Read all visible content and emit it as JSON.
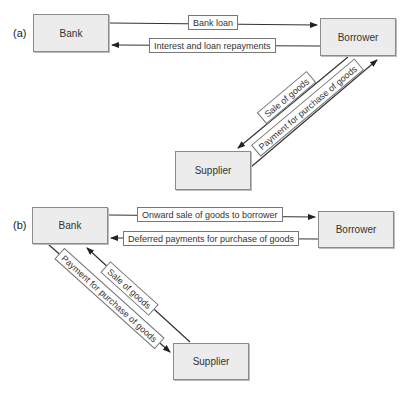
{
  "panels": [
    {
      "label": "(a)",
      "nodes": {
        "bank": "Bank",
        "borrower": "Borrower",
        "supplier": "Supplier"
      },
      "flows": [
        {
          "label": "Bank loan",
          "from": "Bank",
          "to": "Borrower"
        },
        {
          "label": "Interest and loan repayments",
          "from": "Borrower",
          "to": "Bank"
        },
        {
          "label": "Sale of goods",
          "from": "Borrower",
          "to": "Supplier"
        },
        {
          "label": "Payment for purchase of goods",
          "from": "Supplier",
          "to": "Borrower"
        }
      ]
    },
    {
      "label": "(b)",
      "nodes": {
        "bank": "Bank",
        "borrower": "Borrower",
        "supplier": "Supplier"
      },
      "flows": [
        {
          "label": "Onward sale of goods to borrower",
          "from": "Bank",
          "to": "Borrower"
        },
        {
          "label": "Deferred payments for purchase of goods",
          "from": "Borrower",
          "to": "Bank"
        },
        {
          "label": "Sale of goods",
          "from": "Supplier",
          "to": "Bank"
        },
        {
          "label": "Payment for purchase of goods",
          "from": "Bank",
          "to": "Supplier"
        }
      ]
    }
  ],
  "colors": {
    "node_fill": "#ececec",
    "node_border": "#8a8a8a",
    "line": "#222222"
  }
}
